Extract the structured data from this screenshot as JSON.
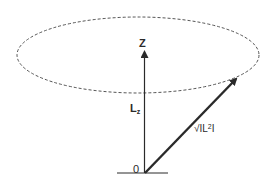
{
  "diagram": {
    "type": "angular-momentum-vector-precession",
    "labels": {
      "z_axis": "Z",
      "lz_main": "L",
      "lz_sub": "z",
      "magnitude_prefix": "√IL",
      "magnitude_sup": "2",
      "magnitude_suffix": "I",
      "origin": "0"
    },
    "colors": {
      "line": "#2a2a2a",
      "dashed_ellipse": "#555555",
      "background": "#ffffff"
    }
  }
}
